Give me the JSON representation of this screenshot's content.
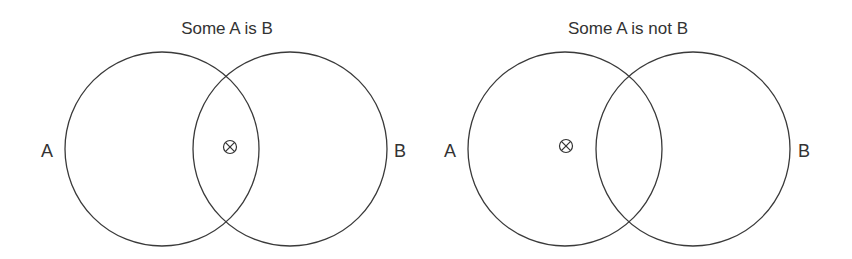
{
  "diagrams": [
    {
      "title": "Some A is B",
      "title_x": 227,
      "title_y": 34,
      "circles": [
        {
          "label": "A",
          "cx": 162,
          "cy": 149,
          "r": 97,
          "label_x": 47,
          "label_y": 157
        },
        {
          "label": "B",
          "cx": 290,
          "cy": 149,
          "r": 97,
          "label_x": 400,
          "label_y": 157
        }
      ],
      "marker": {
        "symbol": "⊗",
        "meaning": "existence marker",
        "region": "A ∩ B",
        "x": 230,
        "y": 147
      }
    },
    {
      "title": "Some A is not B",
      "title_x": 628,
      "title_y": 34,
      "circles": [
        {
          "label": "A",
          "cx": 565,
          "cy": 149,
          "r": 97,
          "label_x": 450,
          "label_y": 157
        },
        {
          "label": "B",
          "cx": 693,
          "cy": 149,
          "r": 97,
          "label_x": 804,
          "label_y": 157
        }
      ],
      "marker": {
        "symbol": "⊗",
        "meaning": "existence marker",
        "region": "A \\ B",
        "x": 566,
        "y": 146
      }
    }
  ],
  "colors": {
    "stroke": "#3a3a3a",
    "text": "#333333",
    "background": "#ffffff"
  }
}
